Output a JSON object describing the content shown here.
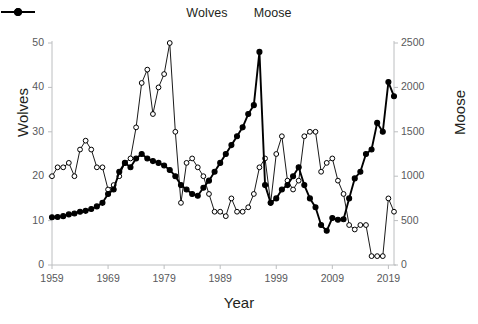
{
  "legend": {
    "items": [
      {
        "label": "Wolves",
        "marker": "open-circle-marker",
        "color": "#000000"
      },
      {
        "label": "Moose",
        "marker": "filled-circle-marker",
        "color": "#000000"
      }
    ]
  },
  "axes": {
    "x_title": "Year",
    "y_left_title": "Wolves",
    "y_right_title": "Moose",
    "x_ticks": [
      "1959",
      "1969",
      "1979",
      "1989",
      "1999",
      "2009",
      "2019"
    ],
    "y_left_ticks": [
      "0",
      "10",
      "20",
      "30",
      "40",
      "50"
    ],
    "y_right_ticks": [
      "0",
      "500",
      "1000",
      "1500",
      "2000",
      "2500"
    ]
  },
  "chart_data": {
    "type": "line",
    "title": "",
    "xlabel": "Year",
    "ylabel": "Wolves",
    "y2label": "Moose",
    "xlim": [
      1959,
      2020
    ],
    "ylim": [
      0,
      50
    ],
    "y2lim": [
      0,
      2500
    ],
    "grid": false,
    "legend_position": "top-center",
    "x": [
      1959,
      1960,
      1961,
      1962,
      1963,
      1964,
      1965,
      1966,
      1967,
      1968,
      1969,
      1970,
      1971,
      1972,
      1973,
      1974,
      1975,
      1976,
      1977,
      1978,
      1979,
      1980,
      1981,
      1982,
      1983,
      1984,
      1985,
      1986,
      1987,
      1988,
      1989,
      1990,
      1991,
      1992,
      1993,
      1994,
      1995,
      1996,
      1997,
      1998,
      1999,
      2000,
      2001,
      2002,
      2003,
      2004,
      2005,
      2006,
      2007,
      2008,
      2009,
      2010,
      2011,
      2012,
      2013,
      2014,
      2015,
      2016,
      2017,
      2018,
      2019,
      2020
    ],
    "series": [
      {
        "name": "Wolves",
        "axis": "left",
        "marker": "open-circle-marker",
        "values": [
          20,
          22,
          22,
          23,
          20,
          26,
          28,
          26,
          22,
          22,
          17,
          18,
          20,
          23,
          24,
          31,
          41,
          44,
          34,
          40,
          43,
          50,
          30,
          14,
          23,
          24,
          22,
          20,
          16,
          12,
          12,
          11,
          15,
          12,
          12,
          13,
          16,
          22,
          24,
          14,
          25,
          29,
          19,
          17,
          19,
          29,
          30,
          30,
          21,
          23,
          24,
          19,
          16,
          9,
          8,
          9,
          9,
          2,
          2,
          2,
          15,
          12
        ]
      },
      {
        "name": "Moose",
        "axis": "right",
        "marker": "filled-circle-marker",
        "values": [
          538,
          540,
          550,
          570,
          580,
          600,
          610,
          630,
          660,
          700,
          800,
          850,
          1050,
          1150,
          1100,
          1200,
          1250,
          1200,
          1170,
          1150,
          1120,
          1070,
          1000,
          900,
          850,
          800,
          780,
          870,
          950,
          1050,
          1150,
          1250,
          1350,
          1450,
          1550,
          1700,
          1800,
          2400,
          900,
          700,
          750,
          850,
          900,
          1000,
          1100,
          900,
          750,
          650,
          450,
          385,
          530,
          510,
          515,
          750,
          975,
          1050,
          1250,
          1300,
          1600,
          1500,
          2060,
          1900
        ]
      }
    ]
  }
}
